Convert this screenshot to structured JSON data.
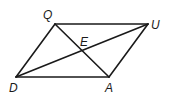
{
  "diagram": {
    "type": "parallelogram-with-diagonals",
    "vertices": {
      "Q": {
        "label": "Q",
        "x": 55,
        "y": 24
      },
      "U": {
        "label": "U",
        "x": 148,
        "y": 24
      },
      "A": {
        "label": "A",
        "x": 109,
        "y": 77
      },
      "D": {
        "label": "D",
        "x": 16,
        "y": 77
      }
    },
    "intersection": {
      "label": "E",
      "x": 82,
      "y": 50
    },
    "sides": [
      "QU",
      "UA",
      "AD",
      "DQ"
    ],
    "diagonals": [
      "QA",
      "DU"
    ],
    "colors": {
      "stroke": "#1a1a1a",
      "background": "#ffffff"
    }
  }
}
